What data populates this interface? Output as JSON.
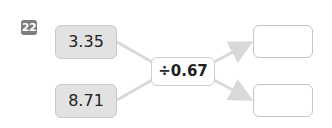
{
  "problem": {
    "number": "22",
    "inputs": [
      {
        "value": "3.35"
      },
      {
        "value": "8.71"
      }
    ],
    "operator": {
      "label": "÷0.67",
      "symbol": "÷",
      "operand": "0.67"
    },
    "outputs": [
      {
        "value": ""
      },
      {
        "value": ""
      }
    ]
  },
  "colors": {
    "badge": "#7d7d7d",
    "input_fill": "#e2e2e2",
    "arrow": "#d9d9d9"
  }
}
